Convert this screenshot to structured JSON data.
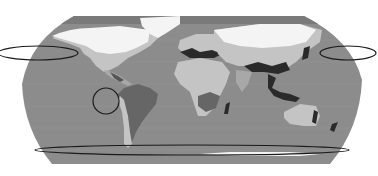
{
  "map": {
    "projection": "Robinson",
    "style": "grayscale world map",
    "colors": {
      "background": "#ffffff",
      "ocean": "#8c8c8c",
      "ocean_dark": "#777777",
      "land_mid": "#a8a8a8",
      "land_light": "#c4c4c4",
      "land_dark_gray": "#666666",
      "ice_snow": "#f4f4f4",
      "hotspot": "#2a2a2a",
      "annotation_stroke": "#1a1a1a"
    },
    "annotations": [
      {
        "type": "ellipse",
        "name": "north-pacific-west-ellipse",
        "cx": 38,
        "cy": 53,
        "rx": 40,
        "ry": 7
      },
      {
        "type": "ellipse",
        "name": "north-pacific-east-ellipse",
        "cx": 348,
        "cy": 53,
        "rx": 28,
        "ry": 7
      },
      {
        "type": "circle",
        "name": "east-pacific-circle",
        "cx": 106,
        "cy": 101,
        "r": 13
      },
      {
        "type": "ellipse",
        "name": "southern-ocean-ellipse",
        "cx": 192,
        "cy": 150,
        "rx": 157,
        "ry": 5
      }
    ]
  }
}
